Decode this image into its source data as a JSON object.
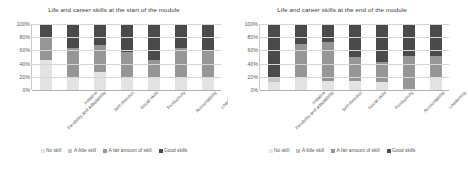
{
  "colors": {
    "no_skill": "#e3e3e3",
    "a_little_skill": "#c4c4c4",
    "a_fair_amount_of_skill": "#969696",
    "good_skills": "#4a4a4a",
    "gridline": "#d6d6d6",
    "axis_text": "#595959",
    "title_text": "#3a3a3a"
  },
  "legend": {
    "items": [
      {
        "label": "No skill",
        "color": "#e3e3e3"
      },
      {
        "label": "A little skill",
        "color": "#c4c4c4"
      },
      {
        "label": "A fair amount of skill",
        "color": "#969696"
      },
      {
        "label": "Good skills",
        "color": "#4a4a4a"
      }
    ]
  },
  "chart_data": [
    {
      "type": "bar",
      "stacked": true,
      "stack_mode": "percent",
      "title": "Life and career skills at the start of the module",
      "xlabel": "",
      "ylabel": "",
      "ylim": [
        0,
        100
      ],
      "yticks": [
        "0%",
        "20%",
        "40%",
        "60%",
        "80%",
        "100%"
      ],
      "grid": true,
      "legend_position": "bottom",
      "categories": [
        "Flexibility and adaptability",
        "Initiative",
        "Self-direction",
        "Social skills",
        "Productivity",
        "Accountability",
        "Leadership"
      ],
      "series": [
        {
          "name": "No skill",
          "color": "#e3e3e3",
          "values": [
            45,
            20,
            27,
            18,
            20,
            18,
            18
          ]
        },
        {
          "name": "A little skill",
          "color": "#c4c4c4",
          "values": [
            0,
            0,
            0,
            0,
            0,
            0,
            0
          ]
        },
        {
          "name": "A fair amount of skill",
          "color": "#969696",
          "values": [
            35,
            43,
            41,
            40,
            26,
            46,
            42
          ]
        },
        {
          "name": "Good skills",
          "color": "#4a4a4a",
          "values": [
            20,
            37,
            32,
            42,
            54,
            36,
            40
          ]
        }
      ]
    },
    {
      "type": "bar",
      "stacked": true,
      "stack_mode": "percent",
      "title": "Life and career skills at the end of the module",
      "xlabel": "",
      "ylabel": "",
      "ylim": [
        0,
        100
      ],
      "yticks": [
        "0%",
        "20%",
        "40%",
        "60%",
        "80%",
        "100%"
      ],
      "grid": true,
      "legend_position": "bottom",
      "categories": [
        "Flexibility and adaptability",
        "Initiative",
        "Self-direction",
        "Social skills",
        "Productivity",
        "Accountability",
        "Leadership"
      ],
      "series": [
        {
          "name": "No skill",
          "color": "#e3e3e3",
          "values": [
            12,
            18,
            13,
            14,
            12,
            2,
            20
          ]
        },
        {
          "name": "A little skill",
          "color": "#c4c4c4",
          "values": [
            8,
            0,
            0,
            0,
            0,
            0,
            0
          ]
        },
        {
          "name": "A fair amount of skill",
          "color": "#969696",
          "values": [
            0,
            52,
            59,
            36,
            30,
            50,
            32
          ]
        },
        {
          "name": "Good skills",
          "color": "#4a4a4a",
          "values": [
            80,
            30,
            28,
            50,
            58,
            48,
            48
          ]
        }
      ]
    }
  ]
}
